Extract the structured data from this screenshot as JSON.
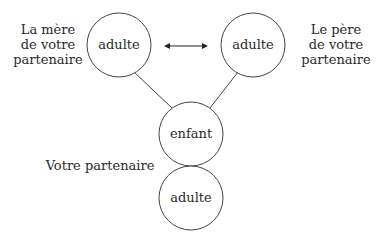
{
  "nodes": {
    "mother": {
      "label": "adulte"
    },
    "father": {
      "label": "adulte"
    },
    "child": {
      "label": "enfant"
    },
    "partner": {
      "label": "adulte"
    }
  },
  "labels": {
    "mother": [
      "La mère",
      "de votre",
      "partenaire"
    ],
    "father": [
      "Le père",
      "de votre",
      "partenaire"
    ],
    "partner": "Votre partenaire"
  },
  "edges": [
    {
      "from": "mother",
      "to": "father",
      "type": "double-arrow"
    },
    {
      "from": "mother",
      "to": "child",
      "type": "line"
    },
    {
      "from": "father",
      "to": "child",
      "type": "line"
    }
  ]
}
